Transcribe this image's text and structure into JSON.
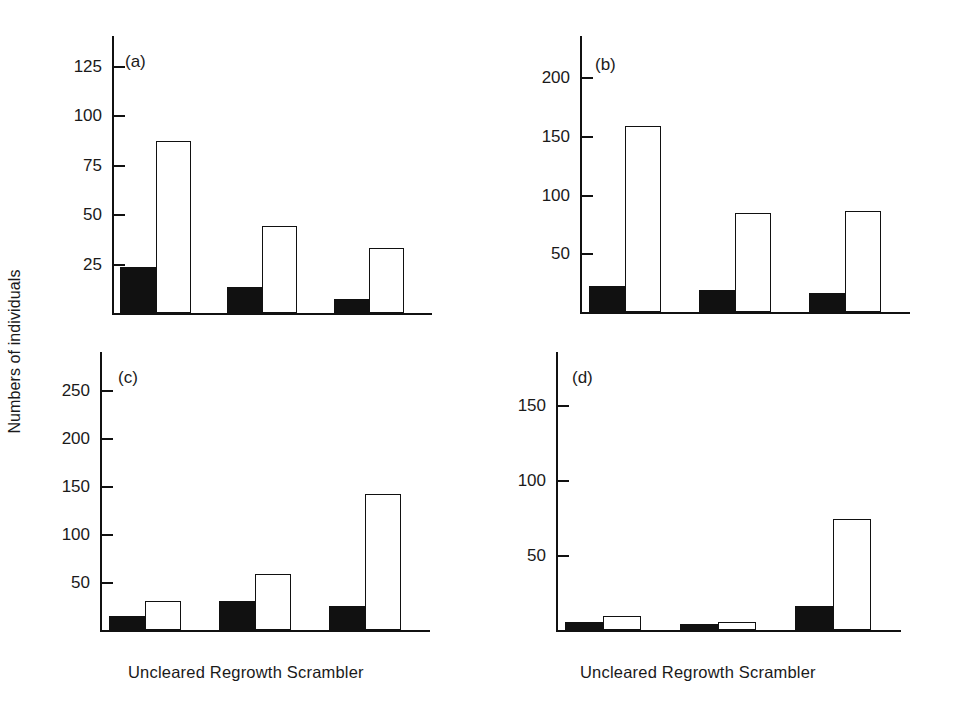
{
  "figure": {
    "ylabel": "Numbers of individuals",
    "categories": [
      "Uncleared",
      "Regrowth",
      "Scrambler"
    ],
    "xaxis_label_text": "Uncleared Regrowth Scrambler",
    "series_names": [
      "solid",
      "open"
    ],
    "colors": {
      "solid": "#111111",
      "open": "#ffffff",
      "axis": "#111111",
      "text": "#1a1a1a"
    }
  },
  "panels": [
    {
      "tag": "(a)",
      "ticks": [
        25,
        50,
        75,
        100,
        125
      ],
      "tick_labels": [
        "25",
        "50",
        "75",
        "100",
        "125"
      ],
      "ymax": 140,
      "solid": [
        23,
        13,
        7
      ],
      "open": [
        87,
        44,
        33
      ]
    },
    {
      "tag": "(b)",
      "ticks": [
        50,
        100,
        150,
        200
      ],
      "tick_labels": [
        "50",
        "100",
        "150",
        "200"
      ],
      "ymax": 235,
      "solid": [
        22,
        19,
        16
      ],
      "open": [
        158,
        84,
        86
      ]
    },
    {
      "tag": "(c)",
      "ticks": [
        50,
        100,
        150,
        200,
        250
      ],
      "tick_labels": [
        "50",
        "100",
        "150",
        "200",
        "250"
      ],
      "ymax": 290,
      "solid": [
        15,
        30,
        25
      ],
      "open": [
        30,
        58,
        142
      ]
    },
    {
      "tag": "(d)",
      "ticks": [
        50,
        100,
        150
      ],
      "tick_labels": [
        "50",
        "100",
        "150"
      ],
      "ymax": 185,
      "solid": [
        5,
        4,
        16
      ],
      "open": [
        9,
        5,
        74
      ]
    }
  ],
  "chart_data": {
    "type": "bar",
    "title": "",
    "xlabel": "",
    "ylabel": "Numbers of individuals",
    "categories": [
      "Uncleared",
      "Regrowth",
      "Scrambler"
    ],
    "grid": false,
    "legend": "none",
    "panels": [
      {
        "id": "a",
        "label": "(a)",
        "ylim": [
          0,
          140
        ],
        "yticks": [
          25,
          50,
          75,
          100,
          125
        ],
        "series": [
          {
            "name": "solid (filled bar)",
            "values": [
              23,
              13,
              7
            ]
          },
          {
            "name": "open (white bar)",
            "values": [
              87,
              44,
              33
            ]
          }
        ]
      },
      {
        "id": "b",
        "label": "(b)",
        "ylim": [
          0,
          235
        ],
        "yticks": [
          50,
          100,
          150,
          200
        ],
        "series": [
          {
            "name": "solid (filled bar)",
            "values": [
              22,
              19,
              16
            ]
          },
          {
            "name": "open (white bar)",
            "values": [
              158,
              84,
              86
            ]
          }
        ]
      },
      {
        "id": "c",
        "label": "(c)",
        "ylim": [
          0,
          290
        ],
        "yticks": [
          50,
          100,
          150,
          200,
          250
        ],
        "series": [
          {
            "name": "solid (filled bar)",
            "values": [
              15,
              30,
              25
            ]
          },
          {
            "name": "open (white bar)",
            "values": [
              30,
              58,
              142
            ]
          }
        ]
      },
      {
        "id": "d",
        "label": "(d)",
        "ylim": [
          0,
          185
        ],
        "yticks": [
          50,
          100,
          150
        ],
        "series": [
          {
            "name": "solid (filled bar)",
            "values": [
              5,
              4,
              16
            ]
          },
          {
            "name": "open (white bar)",
            "values": [
              9,
              5,
              74
            ]
          }
        ]
      }
    ]
  }
}
